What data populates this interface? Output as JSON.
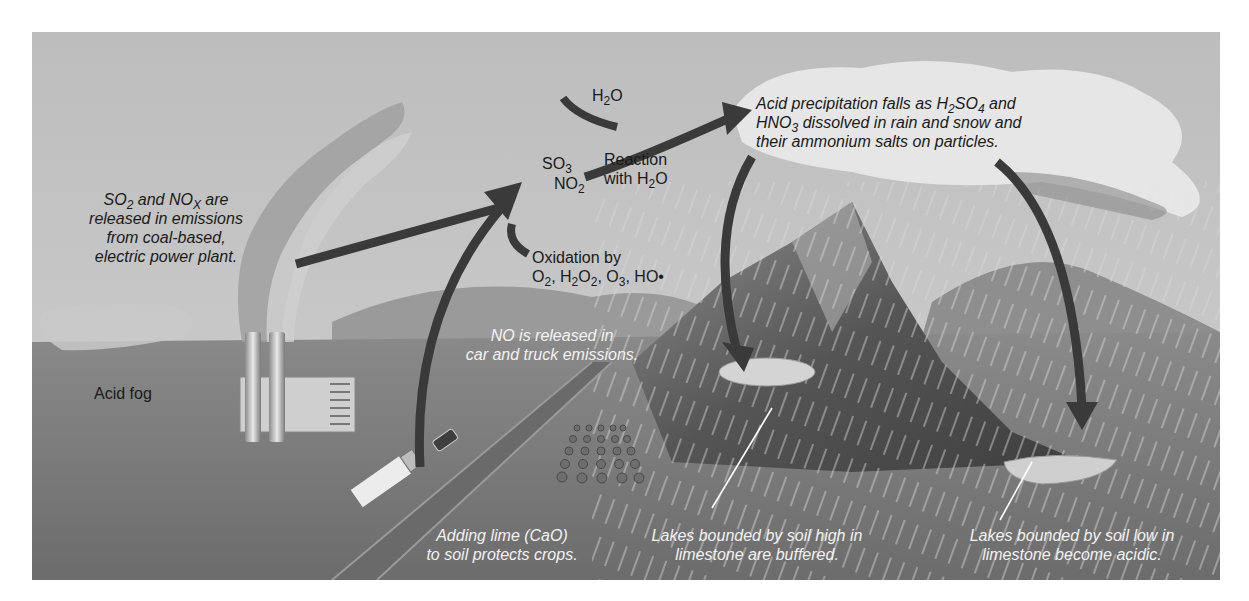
{
  "figure": {
    "background_colors": {
      "sky": "#c4c4c4",
      "ground": "#7a7a7a",
      "cloud": "#e6e6e6",
      "arrow": "#3a3a3a",
      "mountain": "#5e5e5e"
    }
  },
  "labels": {
    "emissions": {
      "line1_a": "SO",
      "line1_a_sub": "2",
      "line1_b": " and NO",
      "line1_b_sub": "X",
      "line1_c": " are",
      "line2": "released in emissions",
      "line3": "from coal-based,",
      "line4": "electric power plant."
    },
    "h2o_top": {
      "a": "H",
      "sub": "2",
      "b": "O"
    },
    "so3": {
      "a": "SO",
      "sub": "3"
    },
    "no2": {
      "a": "NO",
      "sub": "2"
    },
    "reaction": {
      "line1": "Reaction",
      "line2_a": "with H",
      "line2_sub": "2",
      "line2_b": "O"
    },
    "oxidation": {
      "line1": "Oxidation by",
      "line2_a": "O",
      "line2_s1": "2",
      "line2_b": ", H",
      "line2_s2": "2",
      "line2_c": "O",
      "line2_s3": "2",
      "line2_d": ", O",
      "line2_s4": "3",
      "line2_e": ", HO•"
    },
    "precipitation": {
      "line1_a": "Acid precipitation falls as H",
      "line1_s1": "2",
      "line1_b": "SO",
      "line1_s2": "4",
      "line1_c": " and",
      "line2_a": "HNO",
      "line2_s1": "3",
      "line2_b": " dissolved in rain and snow and",
      "line3": "their ammonium salts on particles."
    },
    "acid_fog": "Acid fog",
    "no_release": {
      "line1": "NO is released in",
      "line2": "car and truck emissions."
    },
    "lime": {
      "line1": "Adding lime (CaO)",
      "line2": "to soil protects crops."
    },
    "lakes_high": {
      "line1": "Lakes bounded by soil high in",
      "line2": "limestone are buffered."
    },
    "lakes_low": {
      "line1": "Lakes bounded by soil low in",
      "line2": "limestone become acidic."
    }
  },
  "icons": {
    "power_plant": "power-plant-icon",
    "smoke": "smoke-plume-icon",
    "truck": "truck-icon",
    "car": "car-icon",
    "crops": "crop-field-icon",
    "mountain": "mountain-icon",
    "lake": "lake-icon",
    "cloud": "cloud-icon",
    "rain": "rain-icon"
  }
}
